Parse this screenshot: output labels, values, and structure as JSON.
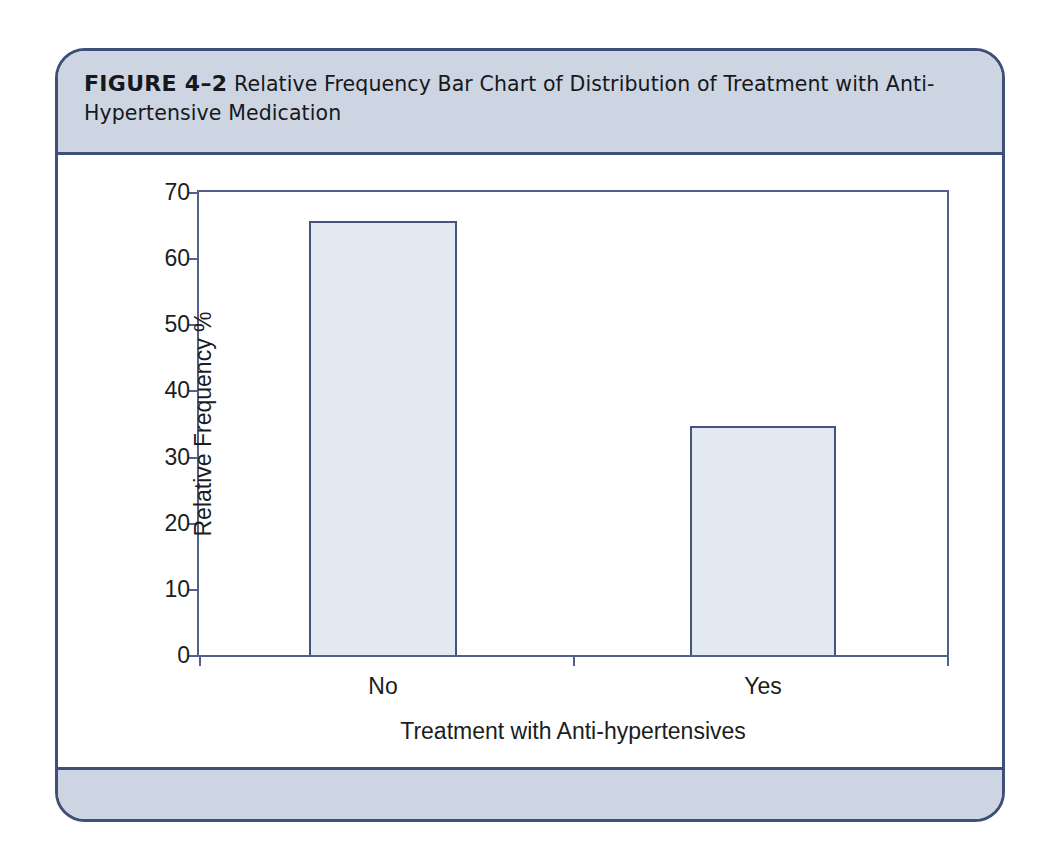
{
  "figure": {
    "label": "FIGURE 4–2",
    "caption": "Relative Frequency Bar Chart of Distribution of Treatment with Anti-Hypertensive Medication",
    "frame_border_color": "#3e4f78",
    "band_color": "#ccd5e1"
  },
  "chart_data": {
    "type": "bar",
    "title": "",
    "categories": [
      "No",
      "Yes"
    ],
    "values": [
      65.6,
      34.6
    ],
    "xlabel": "Treatment with Anti-hypertensives",
    "ylabel": "Relative Frequency %",
    "ylim": [
      0,
      70
    ],
    "yticks": [
      0,
      10,
      20,
      30,
      40,
      50,
      60,
      70
    ],
    "yticklabels": [
      "0",
      "10",
      "20",
      "30",
      "40",
      "50",
      "60",
      "70"
    ],
    "xticklabels": [
      "No",
      "Yes"
    ],
    "grid": false,
    "legend": null,
    "bar_fill_color": "#e2e9f3",
    "bar_edge_color": "#45537f",
    "axis_color": "#52618c"
  }
}
